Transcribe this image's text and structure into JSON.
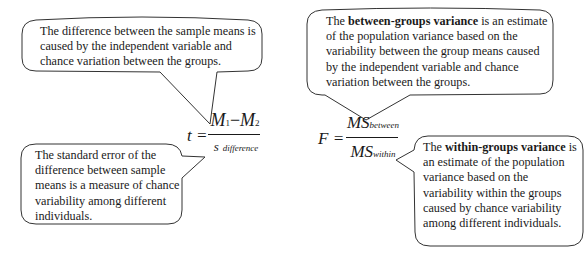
{
  "callouts": {
    "t_numerator_note": {
      "text": "The difference between the sample means is caused by the independent variable and chance variation between the groups."
    },
    "t_denominator_note": {
      "text": "The standard error of the difference between sample means is a measure of chance variability among different individuals."
    },
    "f_numerator_note": {
      "prefix": "The ",
      "bold": "between-groups variance",
      "suffix": " is an estimate of the population variance based on the variability between the group means caused by the independent variable and chance variation between the groups."
    },
    "f_denominator_note": {
      "prefix": "The ",
      "bold": "within-groups variance",
      "suffix": " is an estimate of the population variance based on the variability within the groups caused by chance variability among different individuals."
    }
  },
  "formulas": {
    "t_test": {
      "lhs": "t =",
      "numerator_m1": "M",
      "numerator_sub1": "1",
      "minus": "−",
      "numerator_m2": "M",
      "numerator_sub2": "2",
      "denominator_symbol": "s",
      "denominator_sub": "difference"
    },
    "f_ratio": {
      "lhs": "F =",
      "numerator_symbol": "MS",
      "numerator_sub": "between",
      "denominator_symbol": "MS",
      "denominator_sub": "within"
    }
  },
  "style": {
    "stroke_color": "#333333",
    "text_color": "#1a1a1a",
    "background": "#ffffff"
  }
}
